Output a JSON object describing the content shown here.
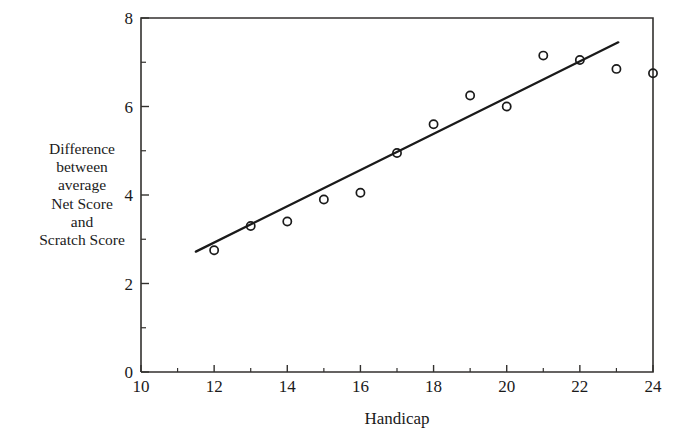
{
  "chart_data": {
    "type": "scatter",
    "title": "",
    "xlabel": "Handicap",
    "ylabel": "Difference between average Net Score and Scratch Score",
    "ylabel_lines": [
      "Difference",
      "between",
      "average",
      "Net Score",
      "and",
      "Scratch Score"
    ],
    "xlim": [
      10,
      24
    ],
    "ylim": [
      0,
      8
    ],
    "xticks": [
      10,
      12,
      14,
      16,
      18,
      20,
      22,
      24
    ],
    "xtick_labels": [
      "10",
      "12",
      "14",
      "16",
      "18",
      "20",
      "22",
      "24"
    ],
    "xminorticks": [
      11,
      13,
      15,
      17,
      19,
      21,
      23
    ],
    "yticks": [
      0,
      2,
      4,
      6,
      8
    ],
    "ytick_labels": [
      "0",
      "2",
      "4",
      "6",
      "8"
    ],
    "yminorticks": [
      1,
      3,
      5,
      7
    ],
    "grid": false,
    "legend": "none",
    "marker": "open-circle",
    "marker_color": "#1a1a1a",
    "line_color": "#1a1a1a",
    "x": [
      12,
      13,
      14,
      15,
      16,
      17,
      18,
      19,
      20,
      21,
      22,
      23,
      24
    ],
    "y": [
      2.75,
      3.3,
      3.4,
      3.9,
      4.05,
      4.95,
      5.6,
      6.25,
      6.0,
      7.15,
      7.05,
      6.85,
      6.75
    ],
    "fit_line": {
      "label": "fitted line",
      "x_start": 11.5,
      "y_start": 2.72,
      "x_end": 23.05,
      "y_end": 7.45
    }
  }
}
